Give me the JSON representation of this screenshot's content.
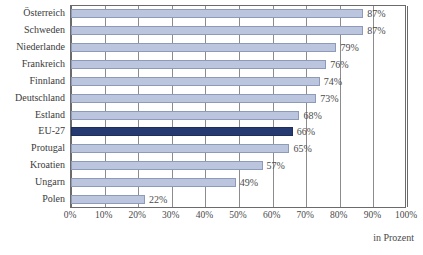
{
  "chart_data": {
    "type": "bar",
    "orientation": "horizontal",
    "title": "",
    "subtitle": "",
    "xlabel": "in Prozent",
    "ylabel": "",
    "xlim": [
      0,
      100
    ],
    "xtick_labels": [
      "0%",
      "10%",
      "20%",
      "30%",
      "40%",
      "50%",
      "60%",
      "70%",
      "80%",
      "90%",
      "100%"
    ],
    "xtick_values": [
      0,
      10,
      20,
      30,
      40,
      50,
      60,
      70,
      80,
      90,
      100
    ],
    "grid": true,
    "grid_axis": "x",
    "legend": "none",
    "categories": [
      "Österreich",
      "Schweden",
      "Niederlande",
      "Frankreich",
      "Finnland",
      "Deutschland",
      "Estland",
      "EU-27",
      "Protugal",
      "Kroatien",
      "Ungarn",
      "Polen"
    ],
    "values": [
      87,
      87,
      79,
      76,
      74,
      73,
      68,
      66,
      65,
      57,
      49,
      22
    ],
    "value_labels": [
      "87%",
      "87%",
      "79%",
      "76%",
      "74%",
      "73%",
      "68%",
      "66%",
      "65%",
      "57%",
      "49%",
      "22%"
    ],
    "highlight_category": "EU-27",
    "highlight_index": 7,
    "colors": {
      "bar_fill": "#bcc5de",
      "bar_border": "#8e9ab9",
      "highlight_fill": "#263a72",
      "highlight_border": "#1d2d5c",
      "gridline": "#8c8c8c",
      "frame": "#6b6b6b",
      "text": "#3b3b3b",
      "background": "#ffffff"
    }
  }
}
